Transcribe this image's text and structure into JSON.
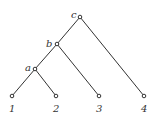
{
  "diagram": {
    "type": "tree",
    "internal_nodes": [
      {
        "id": "c",
        "label": "c"
      },
      {
        "id": "b",
        "label": "b"
      },
      {
        "id": "a",
        "label": "a"
      }
    ],
    "leaves": [
      {
        "id": "1",
        "label": "1"
      },
      {
        "id": "2",
        "label": "2"
      },
      {
        "id": "3",
        "label": "3"
      },
      {
        "id": "4",
        "label": "4"
      }
    ],
    "edges": [
      [
        "c",
        "b"
      ],
      [
        "c",
        "4"
      ],
      [
        "b",
        "a"
      ],
      [
        "b",
        "3"
      ],
      [
        "a",
        "1"
      ],
      [
        "a",
        "2"
      ]
    ]
  }
}
